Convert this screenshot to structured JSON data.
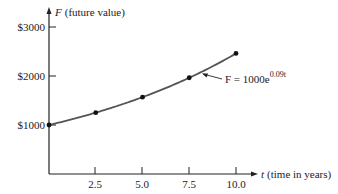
{
  "chart_data": {
    "type": "line",
    "title": "",
    "xlabel": "t (time in years)",
    "ylabel": "F (future value)",
    "x_axis": {
      "var": "t",
      "desc": "(time in years)",
      "ticks": [
        "2.5",
        "5.0",
        "7.5",
        "10.0"
      ],
      "range": [
        0,
        10.5
      ]
    },
    "y_axis": {
      "var": "F",
      "desc": "(future value)",
      "ticks": [
        "$1000",
        "$2000",
        "$3000"
      ],
      "range": [
        0,
        3200
      ]
    },
    "grid": false,
    "series": [
      {
        "name": "F = 1000e^(0.09t)",
        "formula_main": "F = 1000e",
        "formula_exp": "0.09t",
        "x": [
          0,
          2.5,
          5.0,
          7.5,
          10.0
        ],
        "values": [
          1000,
          1252,
          1568,
          1964,
          2460
        ]
      }
    ],
    "annotations": [
      {
        "text": "F = 1000e^0.09t",
        "points_to": "curve near t = 8.5"
      }
    ],
    "colors": {
      "curve": "#555555",
      "axes": "#222222",
      "points": "#111111"
    }
  }
}
